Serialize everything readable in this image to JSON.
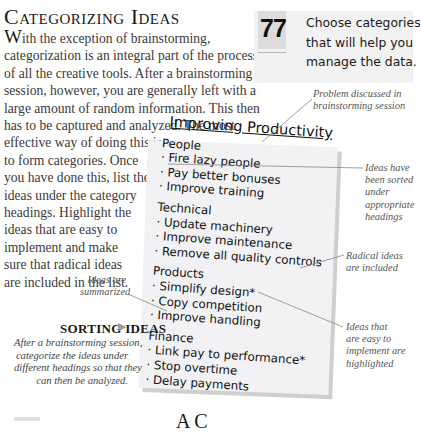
{
  "section": {
    "title": "Categorizing Ideas",
    "body_dropcap": "W",
    "body_lines": [
      "ith the exception of brainstorming,",
      "categorization is an integral part of the process",
      "of all the creative tools. After a brainstorming",
      "session, however, you are generally left with a",
      "large amount of random information. This then",
      "has to be captured and analyzed. The most",
      "effective way of doing this is",
      "to form categories. Once",
      "you have done this, list the",
      "ideas under the category",
      "headings. Highlight the",
      "ideas that are easy to",
      "implement and make",
      "sure that radical ideas",
      "are included in the list."
    ]
  },
  "tip": {
    "number": "77",
    "lines": [
      "Choose categories",
      "that will help you",
      "manage the data."
    ]
  },
  "note": {
    "title": "Improving Productivity",
    "categories": [
      {
        "heading": "People",
        "items": [
          "· Fire lazy people",
          "· Pay better bonuses",
          "· Improve training"
        ]
      },
      {
        "heading": "Technical",
        "items": [
          "· Update machinery",
          "· Improve maintenance",
          "· Remove all quality controls"
        ]
      },
      {
        "heading": "Products",
        "items": [
          "· Simplify design*",
          "· Copy competition",
          "· Improve handling"
        ]
      },
      {
        "heading": "Finance",
        "items": [
          "· Link pay to performance*",
          "· Stop overtime",
          "· Delay payments"
        ]
      }
    ]
  },
  "annotations": {
    "problem": [
      "Problem discussed in",
      "brainstorming session"
    ],
    "sorted": [
      "Ideas have",
      "been sorted",
      "under",
      "appropriate",
      "headings"
    ],
    "radical": [
      "Radical ideas",
      "are included"
    ],
    "easy": [
      "Ideas that",
      "are easy to",
      "implement are",
      "highlighted"
    ],
    "summarized": [
      "Ideas are",
      "summarized"
    ]
  },
  "sidebar_caption": {
    "heading": "SORTING IDEAS",
    "arrow": "▶",
    "lines": [
      "After a brainstorming session,",
      "categorize the ideas under",
      "different headings so that they",
      "can then be analyzed."
    ]
  },
  "next_heading_partial": "A            C"
}
